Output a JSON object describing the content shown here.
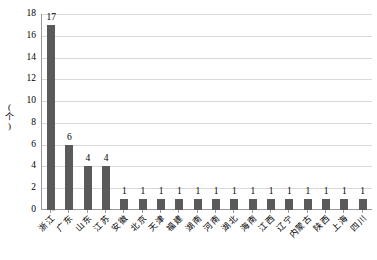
{
  "chart_data": {
    "type": "bar",
    "title": "",
    "subtitle": "",
    "xlabel": "",
    "ylabel": "(个)",
    "ylim": [
      0,
      18
    ],
    "ytick_interval": 2,
    "yticks": [
      0,
      2,
      4,
      6,
      8,
      10,
      12,
      14,
      16,
      18
    ],
    "ytick_labels": [
      "0",
      "2",
      "4",
      "6",
      "8",
      "10",
      "12",
      "14",
      "16",
      "18"
    ],
    "grid": true,
    "grid_orientation": "horizontal",
    "legend": false,
    "legend_position": "none",
    "data_labels": true,
    "categories": [
      "浙江",
      "广东",
      "山东",
      "江苏",
      "安徽",
      "北京",
      "天津",
      "福建",
      "湖南",
      "河南",
      "湖北",
      "海南",
      "江西",
      "辽宁",
      "内蒙古",
      "陕西",
      "上海",
      "四川"
    ],
    "values": [
      17,
      6,
      4,
      4,
      1,
      1,
      1,
      1,
      1,
      1,
      1,
      1,
      1,
      1,
      1,
      1,
      1,
      1
    ],
    "value_labels": [
      "17",
      "6",
      "4",
      "4",
      "1",
      "1",
      "1",
      "1",
      "1",
      "1",
      "1",
      "1",
      "1",
      "1",
      "1",
      "1",
      "1",
      "1"
    ],
    "series": [
      {
        "name": "",
        "values": [
          17,
          6,
          4,
          4,
          1,
          1,
          1,
          1,
          1,
          1,
          1,
          1,
          1,
          1,
          1,
          1,
          1,
          1
        ]
      }
    ]
  },
  "colors": {
    "bar": "#5a5a5a",
    "gridline": "#d9d9d9",
    "axis": "#9a9a9a",
    "background": "#ffffff",
    "text": "#000000"
  }
}
